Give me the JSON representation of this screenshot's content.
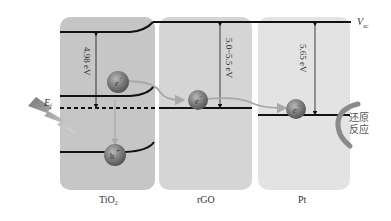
{
  "panels": [
    {
      "name": "TiO2",
      "label_main": "TiO",
      "label_sub": "2",
      "color": "#c6c6c6"
    },
    {
      "name": "rGO",
      "label_main": "rGO",
      "label_sub": "",
      "color": "#d5d5d5"
    },
    {
      "name": "Pt",
      "label_main": "Pt",
      "label_sub": "",
      "color": "#e3e3e3"
    }
  ],
  "vacuum_level": {
    "main": "V",
    "sub": "ac"
  },
  "fermi_label": {
    "main": "E",
    "sub": "f"
  },
  "energy_gaps": [
    {
      "panel": "TiO2",
      "text": "4.98 eV"
    },
    {
      "panel": "rGO",
      "text": "5.0~5.5 eV"
    },
    {
      "panel": "Pt",
      "text": "5.65 eV"
    }
  ],
  "particles": [
    {
      "panel": "TiO2",
      "kind": "electron",
      "text": "e",
      "sign": "-"
    },
    {
      "panel": "TiO2",
      "kind": "hole",
      "text": "h",
      "sign": "+"
    },
    {
      "panel": "rGO",
      "kind": "electron",
      "text": "e",
      "sign": "-"
    },
    {
      "panel": "Pt",
      "kind": "electron",
      "text": "e",
      "sign": "-"
    }
  ],
  "reaction_label": {
    "line1": "还原",
    "line2": "反应"
  },
  "colors": {
    "line": "#111111",
    "arrow_transfer": "#a9a9a9",
    "particle": "#7a7a7a",
    "reaction_arc": "#8a8a8a"
  }
}
